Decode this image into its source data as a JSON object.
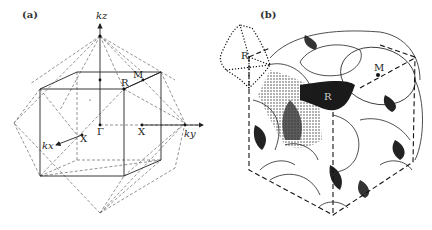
{
  "figure": {
    "panel_a": {
      "label": "(a)",
      "axes": {
        "kz": "kz",
        "ky": "ky",
        "kx": "kx"
      },
      "points": {
        "gamma": "Γ",
        "x_ky": "X",
        "x_kx": "X",
        "m": "M",
        "r": "R"
      },
      "description": "Simple cubic Brillouin zone (cube, solid/dashed edges) inscribed with dashed octahedron; reciprocal axes kx, ky, kz"
    },
    "panel_b": {
      "label": "(b)",
      "points": {
        "r_left": "R",
        "r_center": "R",
        "m": "M"
      },
      "description": "Stippled Fermi surface drawing inside cubic Brillouin zone with dashed edges; dotted outline near R corner"
    },
    "colors": {
      "line": "#222222",
      "dashed": "#555555",
      "background": "#ffffff",
      "shading": "#111111"
    }
  }
}
